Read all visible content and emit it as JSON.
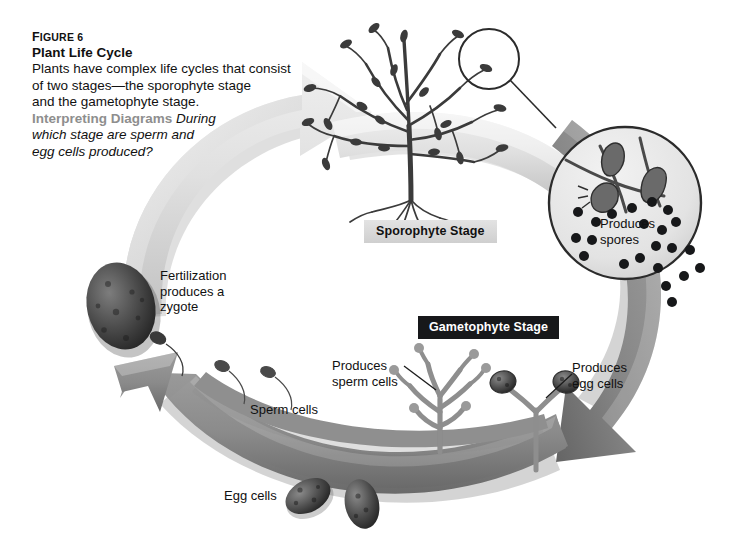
{
  "figure": {
    "number_label": "Figure 6",
    "number_display_caps": "F",
    "number_display_rest": "IGURE 6",
    "title": "Plant Life Cycle",
    "body": "Plants have complex life cycles that consist\nof two stages—the sporophyte stage\nand the gametophyte stage.",
    "skill_label": "Interpreting Diagrams",
    "question": "During\nwhich stage are sperm and\negg cells produced?"
  },
  "stage_labels": {
    "sporophyte": "Sporophyte Stage",
    "gametophyte": "Gametophyte Stage"
  },
  "annotations": {
    "zygote": "Fertilization\nproduces a\nzygote",
    "spores": "Produces\nspores",
    "sperm_production": "Produces\nsperm cells",
    "egg_production": "Produces\negg cells",
    "sperm_cells": "Sperm cells",
    "egg_cells": "Egg cells"
  },
  "colors": {
    "page_background": "#ffffff",
    "text": "#111111",
    "skill_label": "#8e8e8e",
    "sporophyte_label_background": "#d8d8d8",
    "gametophyte_label_background": "#17181a",
    "gametophyte_label_text": "#ffffff",
    "light_arrow": "#dedede",
    "light_arrow_shade": "#bdbdbd",
    "dark_arrow": "#8a8a8a",
    "dark_arrow_shade": "#6e6e6e",
    "plant_dark": "#3b3b3b",
    "magnifier_fill": "#e8e8e8",
    "magnifier_stroke": "#2b2b2b",
    "spore_dot": "#17181a",
    "zygote_fill": "#4a4a4a"
  },
  "graphics": {
    "sporophyte_plant": "branching-plant-with-roots",
    "magnifier_small_circle": "magnifier-selection-circle",
    "magnifier_large_circle": "magnified-spore-branch",
    "gametophyte_male": "branching-gametophyte-antheridia",
    "gametophyte_female": "gametophyte-with-egg-knobs",
    "zygote": "zygote-oval",
    "sperm_cell_count": 2,
    "egg_cell_count": 2,
    "spore_dot_count": 22,
    "cycle_arrow_light": "arc-arrow-upper-left-to-sporophyte",
    "cycle_arrow_dark_right": "arc-arrow-right-down-to-gametophyte",
    "cycle_arrow_dark_left": "arc-arrow-bottom-up-to-zygote"
  }
}
